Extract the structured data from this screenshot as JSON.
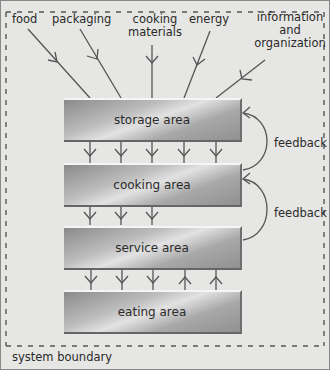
{
  "inputs": [
    {
      "label": "food"
    },
    {
      "label": "packaging"
    },
    {
      "label": "cooking materials"
    },
    {
      "label": "energy"
    },
    {
      "label": "information and organization"
    }
  ],
  "inputs_lines": {
    "cooking1": "cooking",
    "cooking2": "materials",
    "info1": "information",
    "info2": "and",
    "info3": "organization"
  },
  "boxes": [
    {
      "label": "storage area"
    },
    {
      "label": "cooking area"
    },
    {
      "label": "service area"
    },
    {
      "label": "eating area"
    }
  ],
  "feedback": [
    {
      "label": "feedback"
    },
    {
      "label": "feedback"
    }
  ],
  "boundary_label": "system boundary",
  "colors": {
    "line": "#555555",
    "background": "#e6e6e4"
  }
}
